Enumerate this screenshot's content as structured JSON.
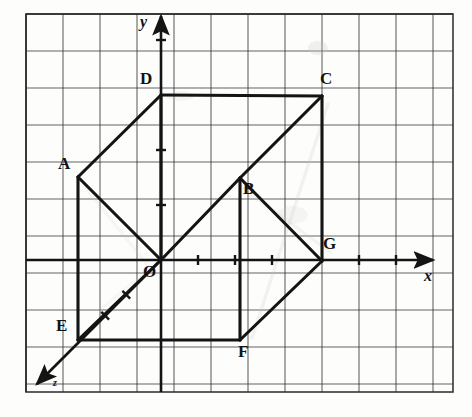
{
  "figure": {
    "background_color": "#fdfdfc",
    "ink_color": "#141414",
    "grid_color": "#2b2b2b",
    "ghost_color": "#c8c8c8"
  },
  "grid": {
    "cell_size": 37,
    "left": 26,
    "top": 14,
    "right": 453,
    "bottom": 392,
    "columns": 12,
    "rows": 11,
    "line_width": 1.1,
    "border_width": 1.6
  },
  "axes": {
    "origin": {
      "x": 161,
      "y": 260,
      "label": "O"
    },
    "x_axis": {
      "label": "x",
      "label_x": 424,
      "label_y": 268,
      "from": {
        "x": 26,
        "y": 260
      },
      "to": {
        "x": 433,
        "y": 260
      },
      "ticks": [
        198,
        235,
        272,
        359,
        396
      ],
      "arrow": true
    },
    "y_axis": {
      "label": "y",
      "label_x": 140,
      "label_y": 14,
      "from": {
        "x": 161,
        "y": 392
      },
      "to": {
        "x": 161,
        "y": 16
      },
      "ticks": [
        40,
        150,
        205
      ],
      "arrow": true
    },
    "z_axis": {
      "label": "z",
      "label_x": 53,
      "label_y": 378,
      "from": {
        "x": 161,
        "y": 260
      },
      "to": {
        "x": 37,
        "y": 384
      },
      "ticks": [
        0.28,
        0.45
      ],
      "arrow": true
    }
  },
  "vertices": [
    {
      "name": "A",
      "x": 78,
      "y": 177,
      "label_x": 58,
      "label_y": 155
    },
    {
      "name": "B",
      "x": 240,
      "y": 178,
      "label_x": 243,
      "label_y": 180
    },
    {
      "name": "C",
      "x": 322,
      "y": 96,
      "label_x": 320,
      "label_y": 70
    },
    {
      "name": "D",
      "x": 161,
      "y": 95,
      "label_x": 140,
      "label_y": 70
    },
    {
      "name": "E",
      "x": 78,
      "y": 340,
      "label_x": 56,
      "label_y": 317
    },
    {
      "name": "F",
      "x": 240,
      "y": 340,
      "label_x": 238,
      "label_y": 343
    },
    {
      "name": "G",
      "x": 322,
      "y": 261,
      "label_x": 323,
      "label_y": 235
    },
    {
      "name": "O",
      "x": 161,
      "y": 260,
      "label_x": 143,
      "label_y": 263
    }
  ],
  "edges": [
    {
      "from": "D",
      "to": "C",
      "style": "solid",
      "note": "top back to top right"
    },
    {
      "from": "A",
      "to": "D",
      "style": "solid",
      "note": "oblique top left"
    },
    {
      "from": "A",
      "to": "O",
      "style": "solid",
      "note": "left vertical front"
    },
    {
      "from": "O",
      "to": "D",
      "style": "solid",
      "note": "y-axis segment back vertical"
    },
    {
      "from": "C",
      "to": "G",
      "style": "solid",
      "note": "right vertical"
    },
    {
      "from": "B",
      "to": "C",
      "style": "solid",
      "note": "oblique middle"
    },
    {
      "from": "O",
      "to": "B",
      "style": "solid",
      "note": "bottom back horizontal"
    },
    {
      "from": "B",
      "to": "G",
      "style": "solid",
      "note": "horizontal to G"
    },
    {
      "from": "B",
      "to": "F",
      "style": "solid",
      "note": "vertical down to F"
    },
    {
      "from": "A",
      "to": "E",
      "style": "solid",
      "note": "left vertical down"
    },
    {
      "from": "E",
      "to": "F",
      "style": "solid",
      "note": "bottom front horizontal"
    },
    {
      "from": "F",
      "to": "G",
      "style": "solid",
      "note": "oblique bottom right"
    },
    {
      "from": "O",
      "to": "E",
      "style": "solid",
      "note": "z-axis segment"
    }
  ],
  "ghost_marks": [
    {
      "type": "line",
      "x1": 328,
      "y1": 104,
      "x2": 252,
      "y2": 338,
      "opacity": 0.22
    },
    {
      "type": "line",
      "x1": 243,
      "y1": 188,
      "x2": 330,
      "y2": 252,
      "opacity": 0.18
    },
    {
      "type": "line",
      "x1": 84,
      "y1": 186,
      "x2": 150,
      "y2": 268,
      "opacity": 0.12
    },
    {
      "type": "line",
      "x1": 100,
      "y1": 310,
      "x2": 170,
      "y2": 252,
      "opacity": 0.1
    },
    {
      "type": "smudge",
      "x": 318,
      "y": 48,
      "w": 10,
      "h": 7,
      "opacity": 0.25
    },
    {
      "type": "smudge",
      "x": 180,
      "y": 96,
      "w": 14,
      "h": 5,
      "opacity": 0.18
    },
    {
      "type": "smudge",
      "x": 292,
      "y": 215,
      "w": 16,
      "h": 9,
      "opacity": 0.16
    }
  ]
}
